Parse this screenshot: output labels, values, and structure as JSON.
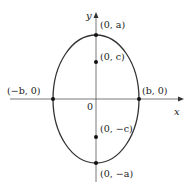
{
  "diagram": {
    "type": "ellipse-vertical-major-axis",
    "axes": {
      "x_label": "x",
      "y_label": "y",
      "origin_label": "0"
    },
    "points": {
      "top_vertex": "(0, a)",
      "top_focus": "(0, c)",
      "left_vertex": "(−b, 0)",
      "right_vertex": "(b, 0)",
      "bottom_focus": "(0, −c)",
      "bottom_vertex": "(0, −a)"
    },
    "colors": {
      "stroke": "#333333",
      "axis": "#555555",
      "background": "#ffffff"
    }
  }
}
